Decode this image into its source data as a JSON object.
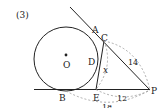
{
  "problem_number": "(3)",
  "points": {
    "A": "A",
    "B": "B",
    "C": "C",
    "D": "D",
    "E": "E",
    "P": "P",
    "O": "O"
  },
  "lengths": {
    "CP": "14",
    "EP": "12",
    "BP": "18",
    "CE": "x"
  },
  "colors": {
    "line": "#222222",
    "dashed": "#999999"
  }
}
